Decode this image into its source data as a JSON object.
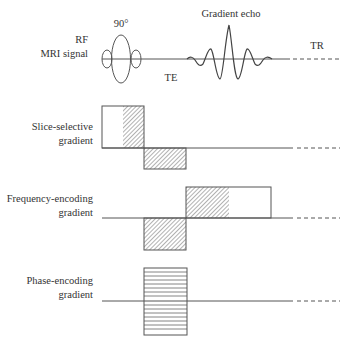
{
  "rows": {
    "rf": {
      "label_line1": "RF",
      "label_line2": "MRI signal",
      "flip_angle": "90°",
      "echo_label": "Gradient echo",
      "te_label": "TE",
      "tr_label": "TR"
    },
    "slice": {
      "label_line1": "Slice-selective",
      "label_line2": "gradient"
    },
    "frequency": {
      "label_line1": "Frequency-encoding",
      "label_line2": "gradient"
    },
    "phase": {
      "label_line1": "Phase-encoding",
      "label_line2": "gradient"
    }
  },
  "colors": {
    "line": "#555555",
    "text": "#333333",
    "hatch": "#666666"
  }
}
